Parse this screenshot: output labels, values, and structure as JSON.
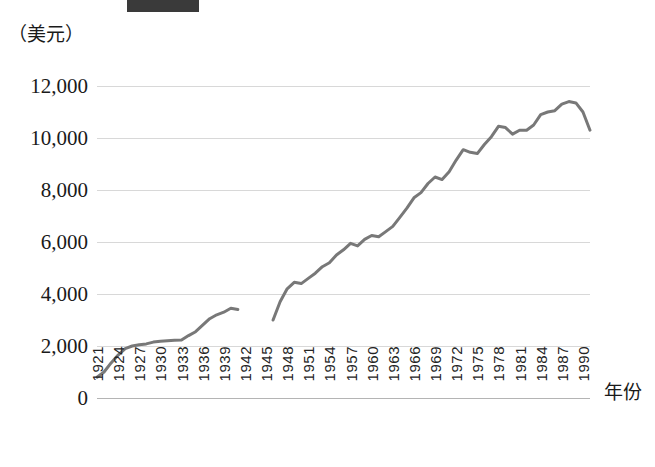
{
  "figure": {
    "top_bar_label": "",
    "y_axis_unit": "（美元）",
    "x_axis_title": "年份"
  },
  "chart_data": {
    "type": "line",
    "title": "",
    "subtitle": "",
    "xlabel": "年份",
    "ylabel": "（美元）",
    "ylim": [
      0,
      13000
    ],
    "xlim": [
      1921,
      1991
    ],
    "grid": true,
    "legend": false,
    "y_ticks": [
      0,
      2000,
      4000,
      6000,
      8000,
      10000,
      12000
    ],
    "y_tick_labels": [
      "0",
      "2,000",
      "4,000",
      "6,000",
      "8,000",
      "10,000",
      "12,000"
    ],
    "x_ticks": [
      1921,
      1924,
      1927,
      1930,
      1933,
      1936,
      1939,
      1942,
      1945,
      1948,
      1951,
      1954,
      1957,
      1960,
      1963,
      1966,
      1969,
      1972,
      1975,
      1978,
      1981,
      1984,
      1987,
      1990
    ],
    "x_tick_labels": [
      "1921",
      "1924",
      "1927",
      "1930",
      "1933",
      "1936",
      "1939",
      "1942",
      "1945",
      "1948",
      "1951",
      "1954",
      "1957",
      "1960",
      "1963",
      "1966",
      "1969",
      "1972",
      "1975",
      "1978",
      "1981",
      "1984",
      "1987",
      "1990"
    ],
    "line_color": "#787878",
    "line_width": 3,
    "series": [
      {
        "name": "segment-1",
        "x": [
          1921,
          1922,
          1923,
          1924,
          1925,
          1926,
          1927,
          1928,
          1929,
          1930,
          1931,
          1932,
          1933,
          1934,
          1935,
          1936,
          1937,
          1938,
          1939,
          1940,
          1941
        ],
        "values": [
          800,
          1000,
          1350,
          1650,
          1900,
          2000,
          2050,
          2080,
          2150,
          2180,
          2200,
          2220,
          2230,
          2400,
          2550,
          2800,
          3050,
          3200,
          3300,
          3450,
          3400
        ]
      },
      {
        "name": "segment-2",
        "x": [
          1946,
          1947,
          1948,
          1949,
          1950,
          1951,
          1952,
          1953,
          1954,
          1955,
          1956,
          1957,
          1958,
          1959,
          1960,
          1961,
          1962,
          1963,
          1964,
          1965,
          1966,
          1967,
          1968,
          1969,
          1970,
          1971,
          1972,
          1973,
          1974,
          1975,
          1976,
          1977,
          1978,
          1979,
          1980,
          1981,
          1982,
          1983,
          1984,
          1985,
          1986,
          1987,
          1988,
          1989,
          1990,
          1991
        ],
        "values": [
          3000,
          3700,
          4200,
          4450,
          4400,
          4600,
          4800,
          5050,
          5200,
          5500,
          5700,
          5950,
          5850,
          6100,
          6250,
          6200,
          6400,
          6600,
          6950,
          7300,
          7700,
          7900,
          8250,
          8500,
          8400,
          8700,
          9150,
          9550,
          9450,
          9400,
          9750,
          10050,
          10450,
          10400,
          10150,
          10300,
          10300,
          10500,
          10900,
          11000,
          11050,
          11300,
          11400,
          11350,
          11000,
          10300
        ]
      }
    ]
  }
}
